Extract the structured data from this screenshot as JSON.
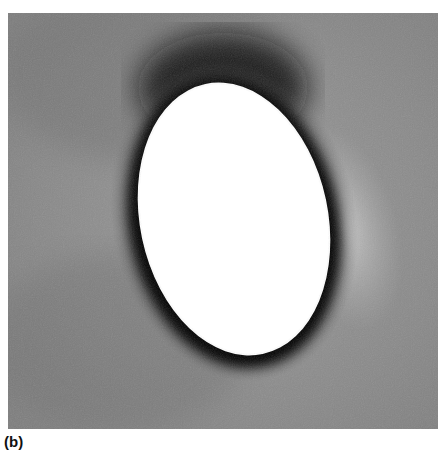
{
  "figure": {
    "panel_label": "(b)",
    "colors": {
      "background_gray": "#8a8a8a",
      "dark_halo": "#0a0a0a",
      "ellipse_fill": "#ffffff",
      "light_region": "#bdbdbd"
    }
  }
}
